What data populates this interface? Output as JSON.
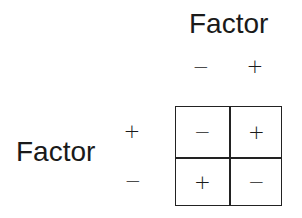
{
  "diagram": {
    "column_factor": {
      "label": "Factor",
      "levels": [
        "−",
        "+"
      ]
    },
    "row_factor": {
      "label": "Factor",
      "levels": [
        "+",
        "−"
      ]
    },
    "cells": [
      [
        "−",
        "+"
      ],
      [
        "+",
        "−"
      ]
    ]
  }
}
